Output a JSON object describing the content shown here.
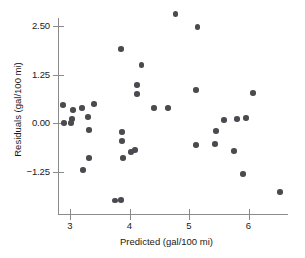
{
  "chart_data": {
    "type": "scatter",
    "title": "",
    "xlabel": "Predicted (gal/100 mi)",
    "ylabel": "Residuals (gal/100 mi)",
    "xlim": [
      2.75,
      6.85
    ],
    "ylim": [
      -2.9,
      3.05
    ],
    "xticks": [
      3,
      4,
      5,
      6
    ],
    "xtick_labels": [
      "3",
      "4",
      "5",
      "6"
    ],
    "yticks": [
      2.5,
      1.25,
      0.0,
      -1.25
    ],
    "ytick_labels": [
      "2.50",
      "1.25",
      "0.00",
      "-1.25"
    ],
    "grid": false,
    "legend": null,
    "marker_color": "#4a4a4f",
    "axis_color": "#8a8a8a",
    "points": [
      {
        "x": 2.88,
        "y": 0.46
      },
      {
        "x": 3.05,
        "y": 0.34
      },
      {
        "x": 3.2,
        "y": 0.39
      },
      {
        "x": 3.4,
        "y": 0.49
      },
      {
        "x": 3.03,
        "y": 0.1
      },
      {
        "x": 3.3,
        "y": 0.15
      },
      {
        "x": 2.9,
        "y": 0.0
      },
      {
        "x": 3.02,
        "y": 0.0
      },
      {
        "x": 3.32,
        "y": -0.18
      },
      {
        "x": 3.32,
        "y": -0.9
      },
      {
        "x": 3.22,
        "y": -1.21
      },
      {
        "x": 3.86,
        "y": 1.9
      },
      {
        "x": 4.2,
        "y": 1.5
      },
      {
        "x": 4.13,
        "y": 0.98
      },
      {
        "x": 4.13,
        "y": 0.75
      },
      {
        "x": 4.41,
        "y": 0.39
      },
      {
        "x": 4.65,
        "y": 0.39
      },
      {
        "x": 3.87,
        "y": -0.23
      },
      {
        "x": 3.87,
        "y": -0.46
      },
      {
        "x": 4.03,
        "y": -0.75
      },
      {
        "x": 4.09,
        "y": -0.7
      },
      {
        "x": 3.89,
        "y": -0.9
      },
      {
        "x": 3.86,
        "y": -1.98
      },
      {
        "x": 3.76,
        "y": -2.0
      },
      {
        "x": 4.77,
        "y": 2.81
      },
      {
        "x": 5.14,
        "y": 2.47
      },
      {
        "x": 5.12,
        "y": 0.85
      },
      {
        "x": 5.59,
        "y": 0.08
      },
      {
        "x": 5.81,
        "y": 0.1
      },
      {
        "x": 5.96,
        "y": 0.13
      },
      {
        "x": 5.45,
        "y": -0.21
      },
      {
        "x": 5.12,
        "y": -0.57
      },
      {
        "x": 5.44,
        "y": -0.54
      },
      {
        "x": 5.76,
        "y": -0.72
      },
      {
        "x": 5.91,
        "y": -1.31
      },
      {
        "x": 6.53,
        "y": -1.78
      },
      {
        "x": 6.08,
        "y": 0.77
      }
    ]
  }
}
